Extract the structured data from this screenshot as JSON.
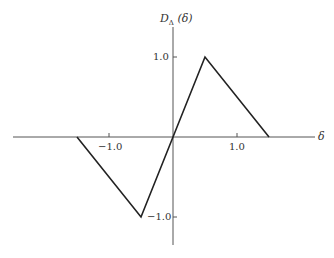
{
  "chart_data": {
    "type": "line",
    "title": "",
    "xlabel": "δ",
    "ylabel": "D_Δ (δ)",
    "ylabel_main": "D",
    "ylabel_sub": "Δ",
    "ylabel_arg": "(δ)",
    "series": [
      {
        "name": "D_Δ(δ)",
        "x": [
          -1.5,
          -0.5,
          0.5,
          1.5
        ],
        "y": [
          0,
          -1.0,
          1.0,
          0
        ]
      }
    ],
    "x_ticks": [
      -1.0,
      1.0
    ],
    "x_tick_labels": [
      "−1.0",
      "1.0"
    ],
    "y_ticks": [
      1.0,
      -1.0
    ],
    "y_tick_labels": [
      "1.0",
      "−1.0"
    ],
    "xlim": [
      -2.5,
      2.2
    ],
    "ylim": [
      -1.35,
      1.4
    ],
    "grid": false,
    "legend": "none"
  },
  "colors": {
    "axis": "#555555",
    "line": "#222222"
  }
}
